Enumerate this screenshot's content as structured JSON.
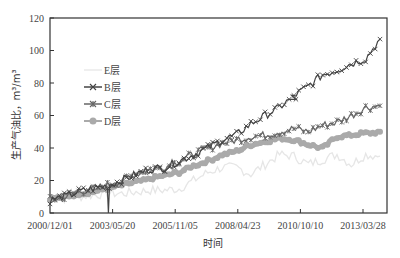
{
  "chart_data": {
    "type": "line",
    "title": "",
    "xlabel": "时间",
    "ylabel": "生产气油比，m³/m³",
    "ylim": [
      0,
      120
    ],
    "yticks": [
      0,
      20,
      40,
      60,
      80,
      100,
      120
    ],
    "xticks": [
      "2000/12/01",
      "2003/05/20",
      "2005/11/05",
      "2008/04/23",
      "2010/10/10",
      "2013/03/28"
    ],
    "grid": false,
    "legend_position": "upper-left-inside",
    "x": [
      "2000/12/01",
      "2001/06",
      "2002/01",
      "2002/08",
      "2003/05/20",
      "2003/12",
      "2004/06",
      "2005/01",
      "2005/06",
      "2005/11/05",
      "2006/06",
      "2007/01",
      "2007/08",
      "2008/04/23",
      "2008/11",
      "2009/06",
      "2010/01",
      "2010/10/10",
      "2011/04",
      "2011/10",
      "2012/04",
      "2012/10",
      "2013/03/28",
      "2013/09"
    ],
    "series": [
      {
        "name": "E层",
        "color": "#e6e6e6",
        "marker": "none",
        "values": [
          9,
          9,
          10,
          11,
          12,
          12,
          13,
          14,
          14,
          15,
          20,
          25,
          28,
          28,
          24,
          30,
          36,
          35,
          30,
          33,
          36,
          30,
          36,
          35
        ]
      },
      {
        "name": "B层",
        "color": "#444444",
        "marker": "x",
        "values": [
          8,
          10,
          13,
          15,
          17,
          20,
          24,
          27,
          28,
          32,
          36,
          40,
          45,
          48,
          55,
          60,
          65,
          72,
          78,
          85,
          88,
          92,
          95,
          107
        ]
      },
      {
        "name": "C层",
        "color": "#666666",
        "marker": "star",
        "values": [
          8,
          10,
          13,
          15,
          17,
          20,
          24,
          27,
          28,
          32,
          36,
          40,
          43,
          45,
          47,
          48,
          50,
          52,
          50,
          54,
          56,
          60,
          65,
          66
        ]
      },
      {
        "name": "D层",
        "color": "#aaaaaa",
        "marker": "circle",
        "values": [
          9,
          10,
          12,
          13,
          15,
          17,
          19,
          21,
          23,
          25,
          29,
          32,
          36,
          38,
          42,
          44,
          46,
          45,
          42,
          40,
          47,
          48,
          49,
          50
        ]
      }
    ],
    "annotations": [
      {
        "series": "B层",
        "x": "2003/05/20",
        "value": 0,
        "note": "sharp drop to 0"
      },
      {
        "series": "B层",
        "x": "2010/10/10",
        "value": 70,
        "note": "sharp dip"
      }
    ]
  }
}
